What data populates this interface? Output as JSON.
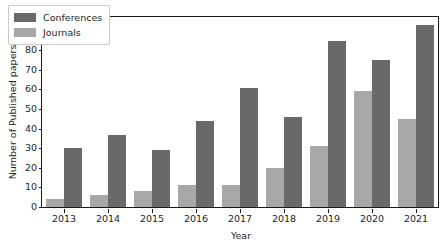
{
  "chart_data": {
    "type": "bar",
    "title": "",
    "xlabel": "Year",
    "ylabel": "Number of Published papers",
    "categories": [
      "2013",
      "2014",
      "2015",
      "2016",
      "2017",
      "2018",
      "2019",
      "2020",
      "2021"
    ],
    "series": [
      {
        "name": "Conferences",
        "color": "#696969",
        "values": [
          30,
          37,
          29,
          44,
          61,
          46,
          85,
          75,
          93
        ]
      },
      {
        "name": "Journals",
        "color": "#a8a8a8",
        "values": [
          4,
          6,
          8,
          11,
          11,
          20,
          31,
          59,
          45
        ]
      }
    ],
    "ylim": [
      0,
      97
    ],
    "yticks": [
      0,
      10,
      20,
      30,
      40,
      50,
      60,
      70,
      80,
      90
    ],
    "ytick_labels": [
      "0",
      "10",
      "20",
      "30",
      "40",
      "50",
      "60",
      "70",
      "80",
      "90"
    ],
    "grid": false,
    "legend_position": "upper left"
  }
}
